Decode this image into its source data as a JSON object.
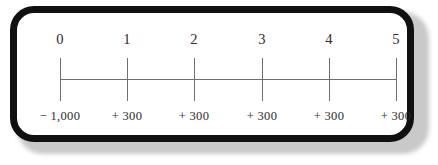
{
  "figure": {
    "type": "timeline-number-line",
    "frame": {
      "border_color": "#101010",
      "background_color": "#ffffff",
      "shadow_color": "#c9c9c9"
    },
    "axis": {
      "line_color": "#6f6f6f",
      "tick_color": "#6f6f6f"
    }
  },
  "chart_data": {
    "type": "line",
    "title": "",
    "xlabel": "",
    "ylabel": "",
    "categories": [
      "0",
      "1",
      "2",
      "3",
      "4",
      "5"
    ],
    "values": [
      -1000,
      300,
      300,
      300,
      300,
      300
    ],
    "grid": false,
    "legend": null,
    "period_labels": [
      "0",
      "1",
      "2",
      "3",
      "4",
      "5"
    ],
    "cash_flow_labels": [
      "− 1,000",
      "+ 300",
      "+ 300",
      "+ 300",
      "+ 300",
      "+ 300"
    ]
  },
  "points": [
    {
      "period": "0",
      "cash_flow": "− 1,000",
      "x": 60
    },
    {
      "period": "1",
      "cash_flow": "+ 300",
      "x": 127
    },
    {
      "period": "2",
      "cash_flow": "+ 300",
      "x": 194
    },
    {
      "period": "3",
      "cash_flow": "+ 300",
      "x": 262
    },
    {
      "period": "4",
      "cash_flow": "+ 300",
      "x": 329
    },
    {
      "period": "5",
      "cash_flow": "+ 300",
      "x": 396
    }
  ]
}
